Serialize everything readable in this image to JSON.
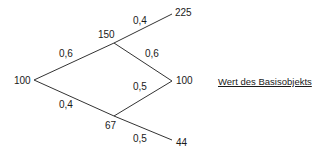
{
  "diagram": {
    "type": "binomial-tree",
    "nodes": {
      "root": "100",
      "up": "150",
      "down": "67",
      "upup": "225",
      "middle": "100",
      "downdown": "44"
    },
    "probabilities": {
      "root_up": "0,6",
      "root_down": "0,4",
      "up_up": "0,4",
      "up_down": "0,6",
      "down_up": "0,5",
      "down_down": "0,5"
    },
    "legend": "Wert des Basisobjekts"
  }
}
